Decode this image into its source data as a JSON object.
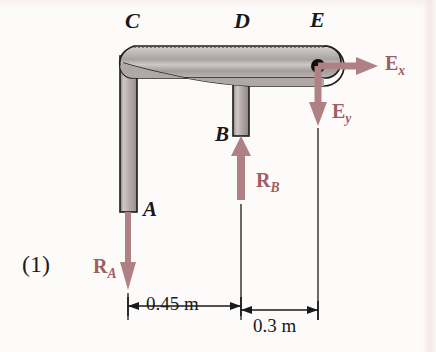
{
  "figure": {
    "index_label": "(1)",
    "background_color": "#fdfbfa",
    "force_color": "#b08184",
    "force_label_color": "#9e5e62",
    "member_fill_color": "#b5aeae",
    "outline_color": "#1c1c1c"
  },
  "point_labels": [
    {
      "id": "C",
      "text": "C"
    },
    {
      "id": "D",
      "text": "D"
    },
    {
      "id": "E",
      "text": "E"
    },
    {
      "id": "B",
      "text": "B"
    },
    {
      "id": "A",
      "text": "A"
    }
  ],
  "forces": [
    {
      "id": "Ex",
      "symbol": "E",
      "subscript": "x",
      "direction": "right",
      "applied_at": "E"
    },
    {
      "id": "Ey",
      "symbol": "E",
      "subscript": "y",
      "direction": "down",
      "applied_at": "E"
    },
    {
      "id": "RB",
      "symbol": "R",
      "subscript": "B",
      "direction": "up",
      "applied_at": "B"
    },
    {
      "id": "RA",
      "symbol": "R",
      "subscript": "A",
      "direction": "down",
      "applied_at": "A"
    }
  ],
  "dimensions": [
    {
      "id": "dim-ab",
      "value": "0.45 m",
      "from": "A",
      "to": "B"
    },
    {
      "id": "dim-be",
      "value": "0.3 m",
      "from": "B",
      "to": "E"
    }
  ]
}
